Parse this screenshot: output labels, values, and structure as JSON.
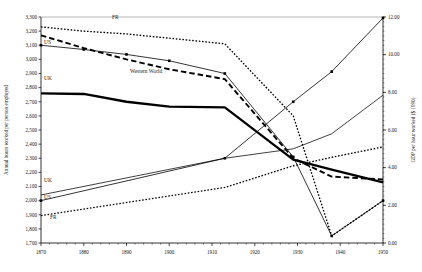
{
  "chart_data": {
    "type": "line",
    "title": "",
    "xlabel": "",
    "ylabel": "Annual hours worked per person employed",
    "y2label": "GDP per hour worked ($ 1990)",
    "grid": false,
    "legend_position": "inline-labels",
    "xlim": [
      1870,
      1950
    ],
    "xticks": [
      1870,
      1880,
      1890,
      1900,
      1910,
      1920,
      1930,
      1940,
      1950
    ],
    "xtick_labels": [
      "1870",
      "1880",
      "1890",
      "1900",
      "1910",
      "1920",
      "1930",
      "1940",
      "1950"
    ],
    "ylim": [
      1700,
      3300
    ],
    "yticks": [
      1700,
      1800,
      1900,
      2000,
      2100,
      2200,
      2300,
      2400,
      2500,
      2600,
      2700,
      2800,
      2900,
      3000,
      3100,
      3200,
      3300
    ],
    "ytick_labels": [
      "1,700",
      "1,800",
      "1,900",
      "2,000",
      "2,100",
      "2,200",
      "2,300",
      "2,400",
      "2,500",
      "2,600",
      "2,700",
      "2,800",
      "2,900",
      "3,000",
      "3,100",
      "3,200",
      "3,300"
    ],
    "y2lim": [
      0,
      12
    ],
    "y2ticks": [
      0,
      2,
      4,
      6,
      8,
      10,
      12
    ],
    "y2tick_labels": [
      "0.00",
      "2.00",
      "4.00",
      "6.00",
      "8.00",
      "10.00",
      "12.00"
    ],
    "series": [
      {
        "name": "FR hours",
        "label": "FR",
        "axis": "left",
        "style": "dotted",
        "x": [
          1870,
          1880,
          1890,
          1900,
          1913,
          1929,
          1938,
          1950
        ],
        "values": [
          3230,
          3200,
          3180,
          3150,
          3110,
          2600,
          1750,
          2000
        ]
      },
      {
        "name": "US hours",
        "label": "US",
        "axis": "left",
        "style": "thin-solid-marker",
        "x": [
          1870,
          1880,
          1890,
          1900,
          1913,
          1929,
          1938,
          1950
        ],
        "values": [
          3100,
          3070,
          3035,
          2990,
          2900,
          2310,
          1750,
          2000
        ]
      },
      {
        "name": "Western World hours",
        "label": "Western World",
        "axis": "left",
        "style": "dashed",
        "x": [
          1870,
          1880,
          1890,
          1900,
          1913,
          1929,
          1938,
          1950
        ],
        "values": [
          3170,
          3080,
          3000,
          2930,
          2860,
          2300,
          2170,
          2150
        ]
      },
      {
        "name": "UK hours",
        "label": "UK",
        "axis": "left",
        "style": "thick-solid",
        "x": [
          1870,
          1880,
          1890,
          1900,
          1913,
          1929,
          1938,
          1950
        ],
        "values": [
          2760,
          2755,
          2700,
          2665,
          2660,
          2290,
          2220,
          2130
        ]
      },
      {
        "name": "UK GDP per hour",
        "label": "UK",
        "axis": "right",
        "style": "thin-solid",
        "x": [
          1870,
          1913,
          1929,
          1938,
          1950
        ],
        "values": [
          2.55,
          4.5,
          5.0,
          5.8,
          7.85
        ]
      },
      {
        "name": "US GDP per hour",
        "label": "US",
        "axis": "right",
        "style": "thin-solid-marker",
        "x": [
          1870,
          1913,
          1929,
          1938,
          1950
        ],
        "values": [
          2.25,
          4.5,
          7.5,
          9.1,
          11.95
        ]
      },
      {
        "name": "FR GDP per hour",
        "label": "FR",
        "axis": "right",
        "style": "dotted",
        "x": [
          1870,
          1913,
          1929,
          1938,
          1950
        ],
        "values": [
          1.45,
          2.95,
          4.1,
          4.55,
          5.1
        ]
      }
    ],
    "inline_labels": [
      {
        "text": "FR",
        "x": 112,
        "y": 19,
        "name": "fr-hours-label"
      },
      {
        "text": "US",
        "x": 44,
        "y": 44,
        "name": "us-hours-label"
      },
      {
        "text": "UK",
        "x": 44,
        "y": 80,
        "name": "uk-hours-label"
      },
      {
        "text": "Western World",
        "x": 130,
        "y": 73,
        "name": "western-world-label"
      },
      {
        "text": "UK",
        "x": 44,
        "y": 182,
        "name": "uk-gdp-label"
      },
      {
        "text": "US",
        "x": 44,
        "y": 199,
        "name": "us-gdp-label"
      },
      {
        "text": "FR",
        "x": 50,
        "y": 219,
        "name": "fr-gdp-label"
      }
    ]
  }
}
